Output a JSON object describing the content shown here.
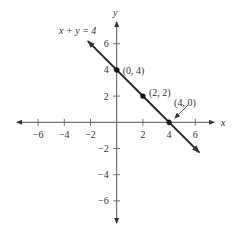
{
  "chart_data": {
    "type": "line",
    "title": "",
    "equation_label": "x + y = 4",
    "xlabel": "x",
    "ylabel": "y",
    "xlim": [
      -7,
      7
    ],
    "ylim": [
      -7,
      7
    ],
    "x_ticks": [
      -6,
      -4,
      -2,
      2,
      4,
      6
    ],
    "y_ticks": [
      -6,
      -4,
      -2,
      2,
      4,
      6
    ],
    "x_tick_labels": [
      "−6",
      "−4",
      "−2",
      "2",
      "4",
      "6"
    ],
    "y_tick_labels": [
      "−6",
      "−4",
      "−2",
      "2",
      "4",
      "6"
    ],
    "grid": false,
    "line": {
      "equation": "x + y = 4",
      "slope": -1,
      "intercept": 4,
      "x_range": [
        -2.2,
        6.3
      ]
    },
    "points": [
      {
        "x": 0,
        "y": 4,
        "label": "(0, 4)"
      },
      {
        "x": 2,
        "y": 2,
        "label": "(2, 2)"
      },
      {
        "x": 4,
        "y": 0,
        "label": "(4, 0)"
      }
    ]
  }
}
